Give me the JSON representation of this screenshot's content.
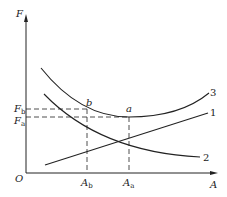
{
  "diagram": {
    "y_axis_label": "F",
    "x_axis_label": "A",
    "origin_label": "O",
    "y_ticks": [
      {
        "base": "F",
        "sub": "b"
      },
      {
        "base": "F",
        "sub": "a"
      }
    ],
    "x_ticks": [
      {
        "base": "A",
        "sub": "b"
      },
      {
        "base": "A",
        "sub": "a"
      }
    ],
    "points": [
      {
        "label": "b"
      },
      {
        "label": "a"
      }
    ],
    "curves": [
      {
        "label": "1",
        "description": "increasing line"
      },
      {
        "label": "2",
        "description": "decreasing curve"
      },
      {
        "label": "3",
        "description": "sum curve with minimum at a"
      }
    ],
    "colors": {
      "line": "#222222"
    }
  }
}
